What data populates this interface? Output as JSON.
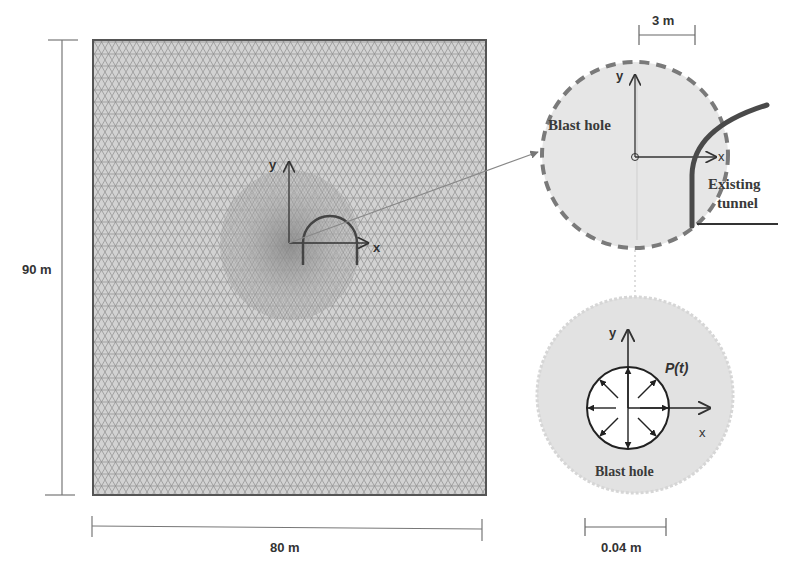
{
  "figure": {
    "mesh_panel": {
      "width_label": "80 m",
      "height_label": "90 m",
      "axis_x_label": "x",
      "axis_y_label": "y",
      "mesh_fill": "#cfcfcf",
      "mesh_line": "#8a8a8a"
    },
    "detail_top": {
      "scale_label": "3 m",
      "blast_hole_label": "Blast hole",
      "tunnel_label_line1": "Existing",
      "tunnel_label_line2": "tunnel",
      "axis_x_label": "x",
      "axis_y_label": "y",
      "circle_fill": "#e6e6e6",
      "dash_color": "#777777",
      "tunnel_color": "#444444"
    },
    "detail_bottom": {
      "scale_label": "0.04 m",
      "blast_hole_label": "Blast hole",
      "pressure_label": "P(t)",
      "axis_x_label": "x",
      "axis_y_label": "y",
      "circle_fill": "#e3e3e3"
    }
  }
}
